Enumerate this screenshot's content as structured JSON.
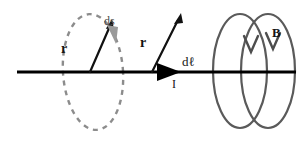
{
  "figure": {
    "background_color": "#ffffff"
  },
  "labels": {
    "r_source": "r",
    "r_field": "r",
    "ds": "ds",
    "dl": "dℓ",
    "current": "I",
    "magnetic_field": "B"
  },
  "colors": {
    "wire": "#000000",
    "vector_arrow": "#0d0d0d",
    "dashed_loop": "#8c8c8c",
    "ds_arrow": "#9a9a9a",
    "coil": "#5a5a5a",
    "text": "#141414",
    "text_gray": "#4a4a4a"
  },
  "geometry": {
    "wire": {
      "x1": 17,
      "y1": 72,
      "x2": 296,
      "y2": 72,
      "width": 3
    },
    "current_arrowhead": {
      "tip_x": 181,
      "tip_y": 72,
      "length": 24,
      "half_height": 9
    },
    "dashed_ellipse": {
      "cx": 93,
      "cy": 72,
      "rx": 30,
      "ry": 58,
      "rotation": -4,
      "dash": "5 5",
      "width": 2.4
    },
    "r_source_vector": {
      "x1": 90,
      "y1": 72,
      "x2": 113,
      "y2": 22
    },
    "r_field_vector": {
      "x1": 152,
      "y1": 72,
      "x2": 181,
      "y2": 16
    },
    "ds_arrow": {
      "x1": 110,
      "y1": 22,
      "x2": 116,
      "y2": 40
    },
    "coil_front": {
      "cx": 240,
      "cy": 71,
      "rx": 28,
      "ry": 58
    },
    "coil_back": {
      "cx": 268,
      "cy": 71,
      "rx": 28,
      "ry": 58
    },
    "b_chevrons": [
      {
        "x": 250,
        "y": 36,
        "width": 13,
        "height": 16
      },
      {
        "x": 272,
        "y": 33,
        "width": 13,
        "height": 16
      }
    ]
  }
}
